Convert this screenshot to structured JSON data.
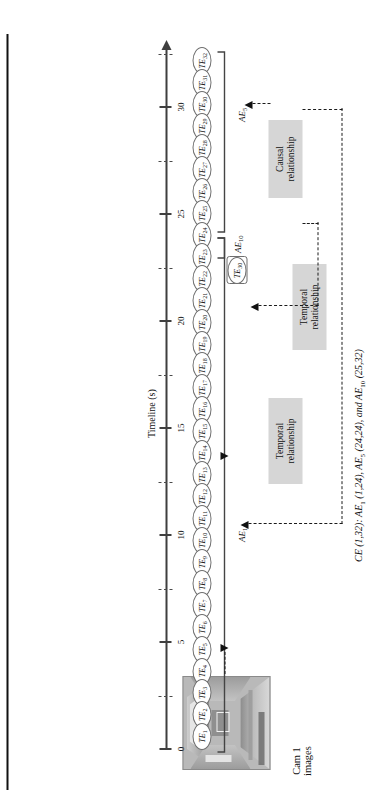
{
  "figure": {
    "title_caption": "CE (1,32): AE1 (1,24), AE5 (24,24), and AE10 (25,32)",
    "caption_parts": {
      "ce": "CE",
      "ce_range": "(1,32):",
      "ae1": "AE",
      "ae1_sub": "1",
      "ae1_range": "(1,24),",
      "ae5": "AE",
      "ae5_sub": "5",
      "ae5_range": "(24,24), and",
      "ae10": "AE",
      "ae10_sub": "10",
      "ae10_range": "(25,32)"
    }
  },
  "axis": {
    "title": "Timeline (s)",
    "major_ticks": [
      "0",
      "5",
      "10",
      "15",
      "20",
      "25",
      "30"
    ],
    "minor_ticks": [
      "",
      "",
      "",
      "",
      "",
      "",
      ""
    ],
    "min": 0,
    "max": 33
  },
  "sources": {
    "cam_label_line1": "Cam 1",
    "cam_label_line2": "images",
    "sound_label": "Gunshot sound"
  },
  "events": {
    "te_prefix": "TE",
    "te_subscripts": [
      "1",
      "2",
      "3",
      "4",
      "5",
      "6",
      "7",
      "8",
      "9",
      "10",
      "11",
      "12",
      "13",
      "14",
      "15",
      "16",
      "17",
      "18",
      "19",
      "20",
      "21",
      "22",
      "23",
      "24",
      "25",
      "26",
      "27",
      "28",
      "29",
      "30",
      "31",
      "32"
    ],
    "te_highlight_label": "TE",
    "te_highlight_sub": "30"
  },
  "atomic_events": {
    "ae1": {
      "label": "AE",
      "sub": "1"
    },
    "ae5": {
      "label": "AE",
      "sub": "5"
    },
    "ae10": {
      "label": "AE",
      "sub": "10"
    }
  },
  "relationships": {
    "temporal_a": {
      "line1": "Temporal",
      "line2": "relationship"
    },
    "temporal_b": {
      "line1": "Temporal",
      "line2": "relationship"
    },
    "causal": {
      "line1": "Causal",
      "line2": "relationship"
    }
  },
  "colors": {
    "relbox_fill": "#d6d6d6",
    "axis": "#3f3f3f",
    "dash": "#1a1a1a",
    "ellipse_stroke": "#6f6f6f"
  }
}
